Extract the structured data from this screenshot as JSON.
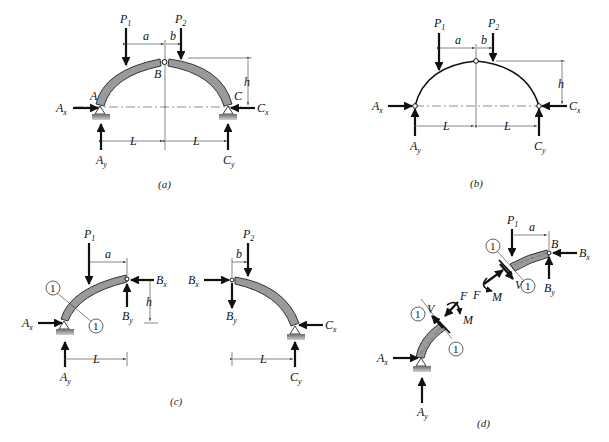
{
  "figure": {
    "panels": [
      {
        "id": "a",
        "caption": "(a)",
        "loads": [
          "P1",
          "P2"
        ],
        "reactions": [
          "Ax",
          "Ay",
          "Cx",
          "Cy"
        ],
        "points": [
          "A",
          "B",
          "C"
        ],
        "dimensions": [
          "a",
          "b",
          "h",
          "L",
          "L"
        ]
      },
      {
        "id": "b",
        "caption": "(b)",
        "loads": [
          "P1",
          "P2"
        ],
        "reactions": [
          "Ax",
          "Ay",
          "Cx",
          "Cy"
        ],
        "dimensions": [
          "a",
          "b",
          "h",
          "L",
          "L"
        ]
      },
      {
        "id": "c",
        "caption": "(c)",
        "left_segment": {
          "loads": [
            "P1"
          ],
          "forces": [
            "Ax",
            "Ay",
            "Bx",
            "By"
          ],
          "dimensions": [
            "a",
            "h",
            "L"
          ],
          "section_marks": [
            "1",
            "1"
          ]
        },
        "right_segment": {
          "loads": [
            "P2"
          ],
          "forces": [
            "Bx",
            "By",
            "Cx",
            "Cy"
          ],
          "dimensions": [
            "b",
            "L"
          ]
        }
      },
      {
        "id": "d",
        "caption": "(d)",
        "upper_segment": {
          "loads": [
            "P1"
          ],
          "forces": [
            "Bx",
            "By",
            "F",
            "V",
            "M"
          ],
          "points": [
            "B"
          ],
          "dimensions": [
            "a"
          ],
          "section_marks": [
            "1",
            "1"
          ]
        },
        "lower_segment": {
          "forces": [
            "Ax",
            "Ay",
            "F",
            "V",
            "M"
          ],
          "section_marks": [
            "1",
            "1"
          ]
        }
      }
    ]
  },
  "labels": {
    "P": "P",
    "A": "A",
    "B": "B",
    "C": "C",
    "one": "1",
    "two": "2",
    "x": "x",
    "y": "y",
    "a": "a",
    "b": "b",
    "h": "h",
    "L": "L",
    "F": "F",
    "V": "V",
    "M": "M",
    "cap_a": "(a)",
    "cap_b": "(b)",
    "cap_c": "(c)",
    "cap_d": "(d)"
  }
}
